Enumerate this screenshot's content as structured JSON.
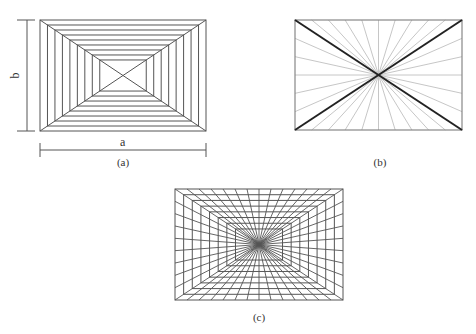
{
  "figure": {
    "panels": [
      {
        "id": "a",
        "caption": "(a)",
        "description": "Nested concentric rectangles with corner-to-center diagonals",
        "rect": {
          "x": 40,
          "y": 20,
          "width": 166,
          "height": 111
        },
        "nested_rectangles": 9,
        "inner_rect_scale": 0.28,
        "dimension_labels": {
          "width": "a",
          "height": "b"
        }
      },
      {
        "id": "b",
        "caption": "(b)",
        "description": "Radial lines from rectangle center to boundary, bold main diagonals",
        "rect": {
          "x": 295,
          "y": 20,
          "width": 167,
          "height": 110
        },
        "rays_per_long_edge": 10,
        "rays_per_short_edge": 6
      },
      {
        "id": "c",
        "caption": "(c)",
        "description": "Perspective grid: nested rectangles combined with radial lines converging at center",
        "rect": {
          "x": 175,
          "y": 189,
          "width": 168,
          "height": 111
        },
        "rays_per_long_edge": 14,
        "rays_per_short_edge": 9,
        "nested_rectangles": 8,
        "inner_rect_scale": 0.28
      }
    ],
    "colors": {
      "line": "#555555",
      "light_line": "#b8b8b8",
      "bold_line": "#222222",
      "background": "#ffffff"
    }
  }
}
